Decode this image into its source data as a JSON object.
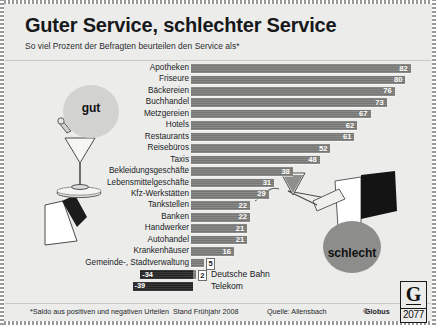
{
  "header": {
    "title": "Guter Service, schlechter Service",
    "subtitle": "So viel Prozent der Befragten beurteilen den Service als*"
  },
  "annotations": {
    "good_label": "gut",
    "bad_label": "schlecht"
  },
  "footer": {
    "note": "*Saldo aus positiven und negativen Urteilen",
    "stand": "Stand Frühjahr 2008",
    "quelle": "Quelle: Allensbach",
    "copyright_prefix": "©",
    "copyright_name": "Globus",
    "logo_letter": "G",
    "logo_number": "2077"
  },
  "chart_data": {
    "type": "bar",
    "title": "Guter Service, schlechter Service",
    "subtitle": "So viel Prozent der Befragten beurteilen den Service als*",
    "orientation": "horizontal",
    "xlabel": "",
    "ylabel": "",
    "xlim": [
      0,
      85
    ],
    "grid": false,
    "legend": "none",
    "unit": "Prozent",
    "categories": [
      "Apotheken",
      "Friseure",
      "Bäckereien",
      "Buchhandel",
      "Metzgereien",
      "Hotels",
      "Restaurants",
      "Reisebüros",
      "Taxis",
      "Bekleidungsgeschäfte",
      "Lebensmittelgeschäfte",
      "Kfz-Werkstätten",
      "Tankstellen",
      "Banken",
      "Handwerker",
      "Autohandel",
      "Krankenhäuser",
      "Gemeinde-, Stadtverwaltung",
      "Post"
    ],
    "values": [
      82,
      80,
      76,
      73,
      67,
      62,
      61,
      52,
      48,
      38,
      31,
      29,
      22,
      22,
      21,
      21,
      16,
      5,
      2
    ],
    "negative_group": {
      "categories": [
        "Deutsche Bahn",
        "Telekom"
      ],
      "values": [
        -34,
        -39
      ],
      "labels": [
        "-34",
        "-39"
      ]
    }
  }
}
